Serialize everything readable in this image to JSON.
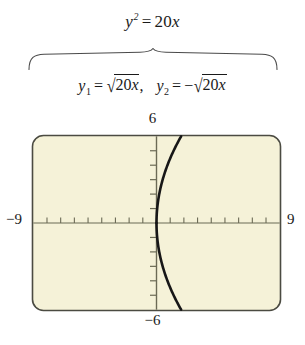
{
  "figure": {
    "type": "graphing-calculator-plot",
    "equation_main": {
      "lhs_var": "y",
      "lhs_exponent": "2",
      "operator": "=",
      "rhs_coefficient": "20",
      "rhs_var": "x",
      "full_text": "y² = 20x"
    },
    "brace": {
      "direction": "down",
      "description": "horizontal curly brace connecting main equation to its two branch functions"
    },
    "branch_equations": {
      "first": {
        "var": "y",
        "subscript": "1",
        "operator": "=",
        "sign": "",
        "radicand_coefficient": "20",
        "radicand_var": "x",
        "full_text": "y₁ = √(20x)"
      },
      "separator": ",",
      "second": {
        "var": "y",
        "subscript": "2",
        "operator": "=",
        "sign": "−",
        "radicand_coefficient": "20",
        "radicand_var": "x",
        "full_text": "y₂ = −√(20x)"
      }
    }
  },
  "chart_data": {
    "type": "line",
    "xlabel": "",
    "ylabel": "",
    "xlim": [
      -9,
      9
    ],
    "ylim": [
      -6,
      6
    ],
    "grid": false,
    "x_tick_labels": {
      "min": "-9",
      "max": "9"
    },
    "y_tick_labels": {
      "min": "-6",
      "max": "6"
    },
    "x_tick_step": 1,
    "y_tick_step": 1,
    "x_tick_count_per_side": 9,
    "y_tick_count_per_side": 5,
    "background_color": "#f5f2d8",
    "border_color": "#4b4b42",
    "curve_color": "#171717",
    "axis_color": "#6b6a55",
    "series": [
      {
        "name": "y₁ = √(20x)",
        "color": "#171717",
        "points": [
          [
            0.0,
            0.0
          ],
          [
            0.05,
            1.0
          ],
          [
            0.2,
            2.0
          ],
          [
            0.45,
            3.0
          ],
          [
            0.8,
            4.0
          ],
          [
            1.25,
            5.0
          ],
          [
            1.8,
            6.0
          ]
        ]
      },
      {
        "name": "y₂ = −√(20x)",
        "color": "#171717",
        "points": [
          [
            0.0,
            0.0
          ],
          [
            0.05,
            -1.0
          ],
          [
            0.2,
            -2.0
          ],
          [
            0.45,
            -3.0
          ],
          [
            0.8,
            -4.0
          ],
          [
            1.25,
            -5.0
          ],
          [
            1.8,
            -6.0
          ]
        ]
      }
    ],
    "annotations": [
      {
        "name": "ymax-label",
        "text": "6",
        "position": "top-center"
      },
      {
        "name": "ymin-label",
        "text": "-6",
        "position": "bottom-center"
      },
      {
        "name": "xmin-label",
        "text": "-9",
        "position": "left-middle"
      },
      {
        "name": "xmax-label",
        "text": "9",
        "position": "right-middle"
      }
    ]
  },
  "labels": {
    "y_max": "6",
    "y_min": "−6",
    "x_min": "−9",
    "x_max": "9"
  },
  "tokens": {
    "y": "y",
    "x": "x",
    "equals": "=",
    "twenty": "20",
    "exp_two": "2",
    "sub_one": "1",
    "sub_two": "2",
    "minus": "−",
    "comma": ",",
    "radical_sign": "√"
  }
}
